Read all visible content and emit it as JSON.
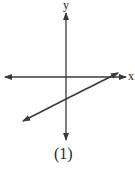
{
  "diagram": {
    "type": "coordinate-graph",
    "axes": {
      "x_label": "x",
      "y_label": "y",
      "color": "#3a3a3a"
    },
    "line": {
      "description": "straight line with positive slope, arrows at both ends, negative y-intercept, positive x-intercept",
      "color": "#3a3a3a"
    },
    "caption": "(1)"
  }
}
